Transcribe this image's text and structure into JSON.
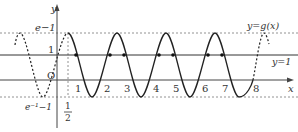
{
  "figure": {
    "curve_label": "y=g(x)",
    "line_label": "y=1",
    "axis_x_label": "x",
    "axis_y_label": "y",
    "origin_label": "O",
    "y_top_label": "e−1",
    "y_one_label": "1",
    "y_bottom_label": "e⁻¹−1",
    "half_num": "1",
    "half_den": "2",
    "x_ticks": [
      "1",
      "2",
      "3",
      "4",
      "5",
      "6",
      "7",
      "8"
    ]
  },
  "colors": {
    "curve": "#222222",
    "axis": "#444444",
    "guide": "#777777",
    "point": "#111111"
  }
}
